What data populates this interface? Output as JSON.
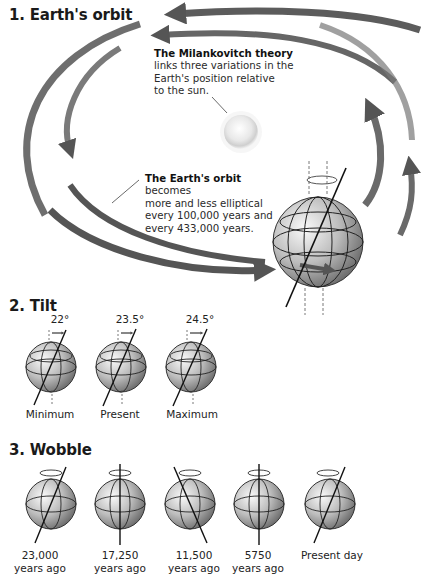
{
  "sections": {
    "orbit": {
      "heading": "1. Earth's orbit",
      "milankovitch": {
        "title": "The Milankovitch theory",
        "lines": [
          "links three variations in the",
          "Earth's position relative",
          "to the sun."
        ]
      },
      "orbit_note": {
        "title": "The Earth's orbit",
        "lines": [
          "becomes",
          "more and less elliptical",
          "every 100,000 years and",
          "every 433,000 years."
        ]
      }
    },
    "tilt": {
      "heading": "2. Tilt",
      "items": [
        {
          "angle": "22°",
          "label": "Minimum"
        },
        {
          "angle": "23.5°",
          "label": "Present"
        },
        {
          "angle": "24.5°",
          "label": "Maximum"
        }
      ]
    },
    "wobble": {
      "heading": "3. Wobble",
      "items": [
        {
          "line1": "23,000",
          "line2": "years ago"
        },
        {
          "line1": "17,250",
          "line2": "years ago"
        },
        {
          "line1": "11,500",
          "line2": "years ago"
        },
        {
          "line1": "5750",
          "line2": "years ago"
        },
        {
          "line1": "Present day",
          "line2": ""
        }
      ]
    }
  },
  "colors": {
    "arrow": "#5a5a5a",
    "globe_light": "#f2f2f2",
    "globe_dark": "#8a8a8a",
    "sun": "#e6e6e6"
  }
}
